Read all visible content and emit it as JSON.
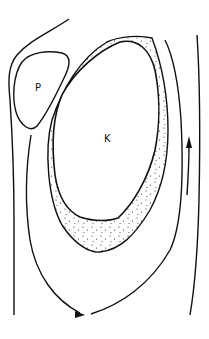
{
  "diagram": {
    "labels": {
      "p": "P",
      "k": "K"
    },
    "colors": {
      "stroke": "#111111",
      "stipple": "#222222",
      "background": "#ffffff"
    },
    "arrows": [
      {
        "name": "right-up-arrow",
        "direction": "up"
      },
      {
        "name": "bottom-right-arrow",
        "direction": "right"
      }
    ]
  }
}
